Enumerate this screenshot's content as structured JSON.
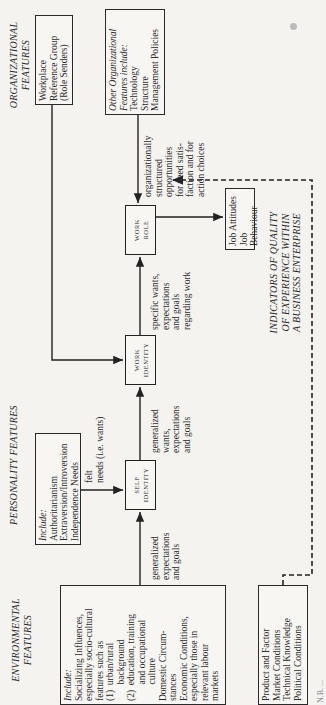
{
  "titles": {
    "environmental": [
      "ENVIRONMENTAL",
      "FEATURES"
    ],
    "personality": "PERSONALITY FEATURES",
    "organizational": [
      "ORGANIZATIONAL",
      "FEATURES"
    ]
  },
  "environmental_box": {
    "include_label": "Include:",
    "lines": [
      "Socializing Influences,",
      "especially socio-cultural",
      "features such as",
      "(1)  urban/rural",
      "       background",
      "(2)  education, training",
      "       and occupational",
      "       culture",
      "Domestic Circum-",
      "stances",
      "Economic Conditions,",
      "especially those in",
      "relevant labour",
      "markets"
    ]
  },
  "market_box": {
    "lines": [
      "Product and Factor",
      "Market Conditions",
      "Technical Knowledge",
      "Political Conditions"
    ]
  },
  "personality_box": {
    "include_label": "Include:",
    "lines": [
      "Authoritarianism",
      "Extraversion/Introversion",
      "Independence Needs"
    ]
  },
  "nodes": {
    "self_identity": [
      "SELF",
      "IDENTITY"
    ],
    "work_identity": [
      "WORK",
      "IDENTITY"
    ],
    "work_role": [
      "WORK",
      "ROLE"
    ]
  },
  "edge_labels": {
    "felt_needs": [
      "felt",
      "needs (i.e. wants)"
    ],
    "env_to_self": [
      "generalized",
      "expectations",
      "and goals"
    ],
    "self_to_work": [
      "generalized",
      "wants,",
      "expectations",
      "and goals"
    ],
    "work_to_role": [
      "specific wants,",
      "expectations",
      "and goals",
      "regarding work"
    ],
    "org_to_role": [
      "organizationally",
      "structured",
      "opportunities",
      "for need satis-",
      "faction and for",
      "action choices"
    ]
  },
  "job_box": {
    "lines": [
      "Job Attitudes",
      "Job Behaviour"
    ]
  },
  "workplace_box": {
    "lines": [
      "Workplace",
      "Reference Group",
      "(Role Senders)"
    ]
  },
  "other_org_box": {
    "italic_lines": [
      "Other Organizational",
      "Features include:"
    ],
    "lines": [
      "Technology",
      "Structure",
      "Management Policies"
    ]
  },
  "indicators": {
    "lines": [
      "INDICATORS OF QUALITY",
      "OF EXPERIENCE WITHIN",
      "A BUSINESS ENTERPRISE"
    ]
  },
  "footnote": {
    "text": "N.B. ..."
  },
  "colors": {
    "ink": "#2a2a2a",
    "paper": "#f4f3f0"
  }
}
